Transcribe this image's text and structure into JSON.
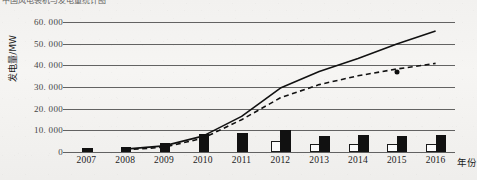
{
  "caption": "中国风电装机与发电量统计图",
  "chart_data": {
    "type": "bar",
    "title": "",
    "xlabel": "年份",
    "ylabel": "发电量/MW",
    "categories": [
      "2007",
      "2008",
      "2009",
      "2010",
      "2011",
      "2012",
      "2013",
      "2014",
      "2015",
      "2016"
    ],
    "ytick_labels": [
      "0",
      "10. 000",
      "20. 000",
      "30. 000",
      "40. 000",
      "50. 000",
      "60. 000"
    ],
    "ytick_values": [
      0,
      10000,
      20000,
      30000,
      40000,
      50000,
      60000
    ],
    "ylim": [
      0,
      60000
    ],
    "grid": true,
    "legend": "none",
    "series": [
      {
        "name": "black-bars",
        "type": "bar",
        "style": "filled-black",
        "values": [
          900,
          1400,
          3200,
          7600,
          7700,
          9200,
          6400,
          6900,
          6300,
          7000
        ]
      },
      {
        "name": "white-bars",
        "type": "bar",
        "style": "hollow-white",
        "values": [
          0,
          0,
          0,
          0,
          0,
          4300,
          2600,
          2900,
          2700,
          3000
        ]
      },
      {
        "name": "solid-line",
        "type": "line",
        "style": "solid",
        "x": [
          "2008",
          "2009",
          "2010",
          "2011",
          "2012",
          "2013",
          "2014",
          "2015",
          "2016"
        ],
        "values": [
          1200,
          2600,
          7000,
          16000,
          29000,
          36500,
          42500,
          49000,
          55000
        ]
      },
      {
        "name": "dashed-line",
        "type": "line",
        "style": "dashed",
        "x": [
          "2008",
          "2009",
          "2010",
          "2011",
          "2012",
          "2013",
          "2014",
          "2015",
          "2016"
        ],
        "values": [
          900,
          2000,
          6000,
          14500,
          24500,
          30500,
          34500,
          37500,
          40000
        ]
      },
      {
        "name": "marker-point",
        "type": "scatter",
        "style": "black-dot",
        "points": [
          {
            "x": "2015",
            "y": 36000
          }
        ]
      }
    ]
  }
}
